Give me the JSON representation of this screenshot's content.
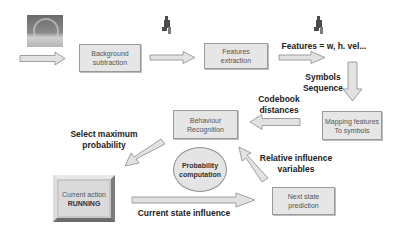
{
  "diagram": {
    "nodes": {
      "input_frame": {
        "label": "",
        "icon": "video-frame-thumbnail"
      },
      "background_subtraction": {
        "line1": "Background",
        "line2": "subtraction"
      },
      "features_extraction": {
        "line1": "Features",
        "line2": "extraction"
      },
      "mapping_features": {
        "line1": "Mapping features",
        "line2": "To symbols"
      },
      "behaviour_recognition": {
        "line1": "Behaviour",
        "line2": "Recognition"
      },
      "probability_computation": {
        "line1": "Probability",
        "line2": "computation"
      },
      "current_action": {
        "line1": "Current action",
        "line2": "RUNNING"
      },
      "next_state_prediction": {
        "line1": "Next state",
        "line2": "prediction"
      }
    },
    "labels": {
      "features": "Features = w, h. vel...",
      "symbols_line1": "Symbols",
      "symbols_line2": "Sequence",
      "codebook_line1": "Codebook",
      "codebook_line2": "distances",
      "select_line1": "Select maximum",
      "select_line2": "probability",
      "relative_line1": "Relative influence",
      "relative_line2": "variables",
      "current_state": "Current state influence"
    },
    "icons": [
      "person-silhouette-icon",
      "person-silhouette-icon"
    ],
    "colors": {
      "box_fill": "#e6e6e6",
      "box_border": "#9a9a9a",
      "arrow_fill": "#e0e0e0",
      "arrow_stroke": "#8a8a8a",
      "text": "#222222"
    }
  }
}
